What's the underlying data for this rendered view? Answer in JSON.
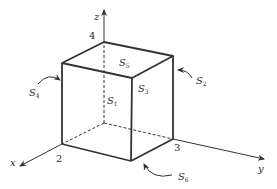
{
  "diagram": {
    "type": "cube-surfaces",
    "axes": {
      "x": "x",
      "y": "y",
      "z": "z"
    },
    "vertex_labels": {
      "v2": "2",
      "v3": "3",
      "v4": "4"
    },
    "surfaces": {
      "s1": {
        "base": "S",
        "sub": "1"
      },
      "s2": {
        "base": "S",
        "sub": "2"
      },
      "s3": {
        "base": "S",
        "sub": "3"
      },
      "s4": {
        "base": "S",
        "sub": "4"
      },
      "s5": {
        "base": "S",
        "sub": "5"
      },
      "s6": {
        "base": "S",
        "sub": "6"
      }
    },
    "colors": {
      "stroke": "#333333",
      "text": "#2b2b2b"
    }
  }
}
